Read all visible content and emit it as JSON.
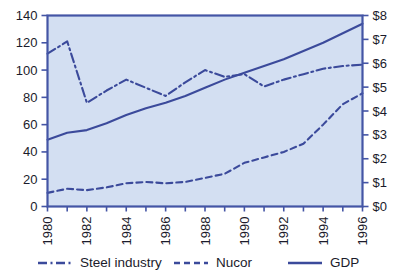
{
  "chart_data": {
    "type": "line",
    "title": "",
    "subtitle": "",
    "xlabel": "",
    "ylabel": "",
    "y2label": "",
    "grid": false,
    "legend_position": "bottom",
    "x": [
      1980,
      1981,
      1982,
      1983,
      1984,
      1985,
      1986,
      1987,
      1988,
      1989,
      1990,
      1991,
      1992,
      1993,
      1994,
      1995,
      1996
    ],
    "xlim": [
      1980,
      1996
    ],
    "xticks": [
      1980,
      1982,
      1984,
      1986,
      1988,
      1990,
      1992,
      1994,
      1996
    ],
    "xtick_labels": [
      "1980",
      "1982",
      "1984",
      "1986",
      "1988",
      "1990",
      "1992",
      "1994",
      "1996"
    ],
    "ylim": [
      0,
      140
    ],
    "yticks": [
      0,
      20,
      40,
      60,
      80,
      100,
      120,
      140
    ],
    "ytick_labels": [
      "0",
      "20",
      "40",
      "60",
      "80",
      "100",
      "120",
      "140"
    ],
    "y2lim": [
      0,
      8
    ],
    "y2ticks": [
      0,
      1,
      2,
      3,
      4,
      5,
      6,
      7,
      8
    ],
    "y2tick_labels": [
      "$0",
      "$1",
      "$2",
      "$3",
      "$4",
      "$5",
      "$6",
      "$7",
      "$8"
    ],
    "series": [
      {
        "name": "Steel industry",
        "style": "dashdot",
        "axis": "left",
        "color": "#3b4a9b",
        "values": [
          112,
          121,
          76,
          85,
          93,
          87,
          81,
          91,
          100,
          95,
          97,
          88,
          93,
          97,
          101,
          103,
          104
        ]
      },
      {
        "name": "Nucor",
        "style": "dashed",
        "axis": "left",
        "color": "#3b4a9b",
        "values": [
          10,
          13,
          12,
          14,
          17,
          18,
          17,
          18,
          21,
          24,
          32,
          36,
          40,
          46,
          60,
          75,
          83
        ]
      },
      {
        "name": "GDP",
        "style": "solid",
        "axis": "left",
        "color": "#3b4a9b",
        "values": [
          49,
          54,
          56,
          61,
          67,
          72,
          76,
          81,
          87,
          93,
          98,
          103,
          108,
          114,
          120,
          127,
          134
        ]
      }
    ]
  },
  "legend": {
    "items": [
      {
        "label": "Steel industry",
        "style": "dashdot"
      },
      {
        "label": "Nucor",
        "style": "dashed"
      },
      {
        "label": "GDP",
        "style": "solid"
      }
    ]
  },
  "colors": {
    "line": "#3b4a9b",
    "plot_background": "#d3dff2",
    "axis": "#4455a5",
    "text": "#1b1b2b",
    "page_background": "#ffffff"
  }
}
